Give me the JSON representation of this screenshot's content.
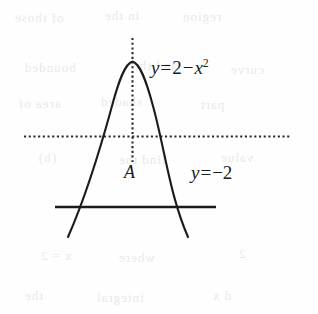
{
  "figure": {
    "kind": "graph-sketch",
    "background_color": "#fefefe",
    "ink_color": "#1b1b1b",
    "ghost_color": "#e9e9ec"
  },
  "labels": {
    "curve": {
      "full_text": "y = 2 - x^2",
      "lhs": "y",
      "equals": "=",
      "term_constant": "2",
      "minus": "−",
      "term_var": "x",
      "term_exponent": "2"
    },
    "horizontal_line": {
      "full_text": "y = -2",
      "lhs": "y",
      "equals": "=",
      "value": "−2"
    },
    "point": {
      "name": "A"
    }
  },
  "chart_data": {
    "type": "line",
    "title": "",
    "xlabel": "",
    "ylabel": "",
    "grid": false,
    "legend": "none",
    "xlim": [
      -3,
      3
    ],
    "ylim": [
      -4,
      3
    ],
    "series": [
      {
        "name": "y = 2 - x^2",
        "style": "solid-curve",
        "x": [
          -2.45,
          -2.2,
          -2.0,
          -1.75,
          -1.5,
          -1.25,
          -1.0,
          -0.75,
          -0.5,
          -0.25,
          0,
          0.25,
          0.5,
          0.75,
          1.0,
          1.25,
          1.5,
          1.75,
          2.0,
          2.2,
          2.45
        ],
        "y": [
          -4.0,
          -2.84,
          -2.0,
          -1.06,
          -0.25,
          0.44,
          1.0,
          1.44,
          1.75,
          1.94,
          2.0,
          1.94,
          1.75,
          1.44,
          1.0,
          0.44,
          -0.25,
          -1.06,
          -2.0,
          -2.84,
          -4.0
        ]
      },
      {
        "name": "y = -2",
        "style": "solid-line",
        "x": [
          -2.6,
          2.6
        ],
        "y": [
          -2,
          -2
        ]
      },
      {
        "name": "x-axis",
        "style": "dotted-line",
        "x": [
          -3.6,
          4.6
        ],
        "y": [
          0,
          0
        ]
      },
      {
        "name": "axis-of-symmetry",
        "style": "dotted-line",
        "x": [
          0,
          0
        ],
        "y": [
          -0.9,
          2.75
        ]
      }
    ],
    "annotations": [
      {
        "text": "A",
        "x": 0,
        "y": -1.1,
        "note": "origin / vertex foot label"
      },
      {
        "text": "y = 2 - x^2",
        "x": 0.75,
        "y": 2.2
      },
      {
        "text": "y = -2",
        "x": 2.0,
        "y": -1.1
      }
    ]
  },
  "ghost_text": [
    {
      "text": "of those",
      "x": 14,
      "y": 10,
      "size": 13,
      "rot": -1
    },
    {
      "text": "in the",
      "x": 104,
      "y": 8,
      "size": 13,
      "rot": 0
    },
    {
      "text": "region",
      "x": 182,
      "y": 9,
      "size": 13,
      "rot": 1
    },
    {
      "text": "bounded",
      "x": 24,
      "y": 60,
      "size": 13,
      "rot": 0
    },
    {
      "text": "and the",
      "x": 132,
      "y": 58,
      "size": 13,
      "rot": 0
    },
    {
      "text": "curve",
      "x": 230,
      "y": 62,
      "size": 13,
      "rot": 0
    },
    {
      "text": "area of",
      "x": 18,
      "y": 96,
      "size": 13,
      "rot": 0
    },
    {
      "text": "shaded",
      "x": 100,
      "y": 94,
      "size": 13,
      "rot": 0
    },
    {
      "text": "part",
      "x": 200,
      "y": 97,
      "size": 13,
      "rot": 0
    },
    {
      "text": "(b)",
      "x": 38,
      "y": 150,
      "size": 13,
      "rot": 0
    },
    {
      "text": "find the",
      "x": 118,
      "y": 152,
      "size": 13,
      "rot": 0
    },
    {
      "text": "value",
      "x": 220,
      "y": 150,
      "size": 13,
      "rot": 0
    },
    {
      "text": "x = 2",
      "x": 40,
      "y": 248,
      "size": 13,
      "rot": 0
    },
    {
      "text": "where",
      "x": 118,
      "y": 250,
      "size": 13,
      "rot": 0
    },
    {
      "text": "2",
      "x": 238,
      "y": 246,
      "size": 13,
      "rot": 0
    },
    {
      "text": "the",
      "x": 24,
      "y": 288,
      "size": 13,
      "rot": 0
    },
    {
      "text": "integral",
      "x": 96,
      "y": 290,
      "size": 13,
      "rot": 0
    },
    {
      "text": "d x",
      "x": 212,
      "y": 288,
      "size": 13,
      "rot": 0
    }
  ]
}
